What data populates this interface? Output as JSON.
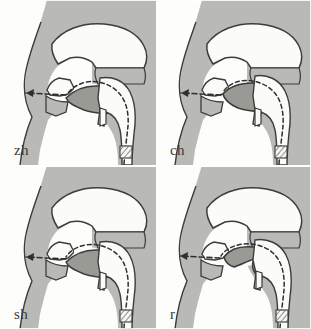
{
  "figure": {
    "layout": "2x2 grid of mid-sagittal head diagrams",
    "width_px": 311,
    "height_px": 329,
    "background_color": "#fdfdfc"
  },
  "colors": {
    "tissue_gray": "#b9b9b5",
    "tissue_gray_light": "#c6c6c1",
    "tongue_gray": "#9a9a95",
    "cavity_white": "#fbfbf9",
    "outline_dark": "#3c3c3c",
    "outline_mid": "#5a5a5a",
    "dashed_airflow": "#2f2f2f",
    "label_text": "#3a3a3a",
    "page_background": "#ffffff"
  },
  "panels": [
    {
      "id": "panel-zh",
      "label": "zh",
      "position": "top-left",
      "sound": "zh",
      "articulation": "voiced post-alveolar fricative",
      "tongue_shape": "blade raised toward post-alveolar region, narrow groove",
      "airflow": "continuous dashed line from larynx through pharynx and oral cavity, exiting at lips",
      "arrow_direction": "left",
      "larynx_marker": "hatched vocal fold band",
      "features": [
        "nasal cavity outlined, velum raised",
        "hard palate dome",
        "upper and lower lip",
        "epiglottis notch",
        "pharyngeal channel"
      ]
    },
    {
      "id": "panel-ch",
      "label": "ch",
      "position": "top-right",
      "sound": "ch",
      "articulation": "voiceless post-alveolar affricate",
      "tongue_shape": "broad flat contact across post-alveolar region, full closure then release",
      "airflow": "continuous dashed line from larynx through pharynx and oral cavity, exiting at lips",
      "arrow_direction": "left",
      "larynx_marker": "hatched vocal fold band",
      "features": [
        "nasal cavity outlined, velum raised",
        "hard palate dome",
        "upper and lower lip",
        "epiglottis notch",
        "pharyngeal channel"
      ]
    },
    {
      "id": "panel-sh",
      "label": "sh",
      "position": "bottom-left",
      "sound": "sh",
      "articulation": "voiceless post-alveolar fricative",
      "tongue_shape": "blade raised toward post-alveolar region, narrow groove",
      "airflow": "continuous dashed line from larynx through pharynx and oral cavity, exiting at lips",
      "arrow_direction": "left",
      "larynx_marker": "hatched vocal fold band",
      "features": [
        "nasal cavity outlined, velum raised",
        "hard palate dome",
        "upper and lower lip",
        "epiglottis notch",
        "pharyngeal channel"
      ]
    },
    {
      "id": "panel-r",
      "label": "r",
      "position": "bottom-right",
      "sound": "r",
      "articulation": "voiced post-alveolar approximant",
      "tongue_shape": "tongue bunched and retracted, tip curled with wide central channel",
      "airflow": "continuous dashed line from larynx through pharynx and oral cavity, exiting at lips",
      "arrow_direction": "left",
      "larynx_marker": "hatched vocal fold band",
      "features": [
        "nasal cavity outlined, velum raised",
        "hard palate dome",
        "upper and lower lip",
        "epiglottis notch",
        "pharyngeal channel"
      ]
    }
  ]
}
